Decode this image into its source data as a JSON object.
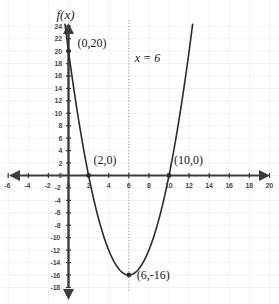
{
  "chart_data": {
    "type": "line",
    "title": "",
    "subtitle": "",
    "xlabel": "",
    "ylabel": "f(x)",
    "xlim": [
      -7,
      25
    ],
    "ylim": [
      -19,
      25
    ],
    "grid": true,
    "legend": "none",
    "function_label": "f(x)",
    "equation": "f(x) = x^2 - 12x + 20",
    "series": [
      {
        "name": "parabola",
        "type": "quadratic",
        "a": 1,
        "b": -12,
        "c": 20,
        "vertex": [
          6,
          -16
        ],
        "roots": [
          2,
          10
        ],
        "y_intercept": 20,
        "color": "#2b2b2b",
        "x_start": -0.35,
        "x_end": 12.35
      }
    ],
    "axis_of_symmetry": {
      "x": 6,
      "label": "x = 6",
      "style": "dotted",
      "color": "#9a9a9a"
    },
    "points": [
      {
        "name": "y-intercept",
        "x": 0,
        "y": 20,
        "label": "(0,20)",
        "label_dx": 9,
        "label_dy": -14
      },
      {
        "name": "root-left",
        "x": 2,
        "y": 0,
        "label": "(2,0)",
        "label_dx": 5,
        "label_dy": -22
      },
      {
        "name": "root-right",
        "x": 10,
        "y": 0,
        "label": "(10,0)",
        "label_dx": 5,
        "label_dy": -22
      },
      {
        "name": "vertex",
        "x": 6,
        "y": -16,
        "label": "(6,-16)",
        "label_dx": 8,
        "label_dy": -6
      }
    ],
    "x_ticks": [
      -6,
      -4,
      -2,
      0,
      2,
      4,
      6,
      8,
      10,
      12,
      14,
      16,
      18,
      20,
      22,
      24
    ],
    "x_tick_labels": [
      "-6",
      "-4",
      "-2",
      "0",
      "2",
      "4",
      "6",
      "8",
      "10",
      "12",
      "14",
      "16",
      "18",
      "20",
      "22",
      "24"
    ],
    "y_ticks": [
      24,
      22,
      20,
      18,
      16,
      14,
      12,
      10,
      8,
      6,
      4,
      2,
      0,
      -2,
      -4,
      -6,
      -8,
      -10,
      -12,
      -14,
      -16,
      -18
    ],
    "y_tick_labels": [
      "24",
      "22",
      "20",
      "18",
      "16",
      "14",
      "12",
      "10",
      "8",
      "6",
      "4",
      "2",
      "0",
      "-2",
      "-4",
      "-6",
      "-8",
      "-10",
      "-12",
      "-14",
      "-16",
      "-18"
    ],
    "colors": {
      "curve": "#2b2b2b",
      "axis": "#3c3c3c",
      "grid": "#f2f2f2",
      "symmetry": "#9e9e9e",
      "tick_text": "#4a4a4a",
      "label_text": "#1a1a1a",
      "background": "#ffffff"
    }
  }
}
